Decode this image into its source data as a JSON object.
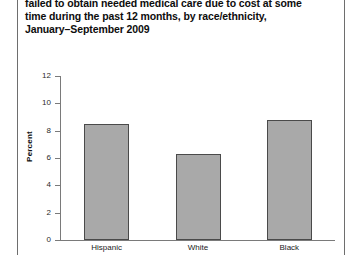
{
  "title": {
    "lines": [
      "failed to obtain needed medical care due to cost at some",
      "time during the past 12 months, by race/ethnicity,",
      "January–September 2009"
    ]
  },
  "chart_data": {
    "type": "bar",
    "title": "failed to obtain needed medical care due to cost at some time during the past 12 months, by race/ethnicity, January–September 2009",
    "categories": [
      "Hispanic",
      "White",
      "Black"
    ],
    "values": [
      8.5,
      6.3,
      8.8
    ],
    "xlabel": "",
    "ylabel": "Percent",
    "ylim": [
      0,
      12
    ],
    "yticks": [
      0,
      2,
      4,
      6,
      8,
      10,
      12
    ],
    "ytick_labels": [
      "0",
      "2",
      "4",
      "6",
      "8",
      "10",
      "12"
    ],
    "grid": false,
    "legend": false,
    "bar_color": "#a9a9a9",
    "bar_edge_color": "#4a4a4a",
    "axis_color": "#7a7a7a"
  }
}
